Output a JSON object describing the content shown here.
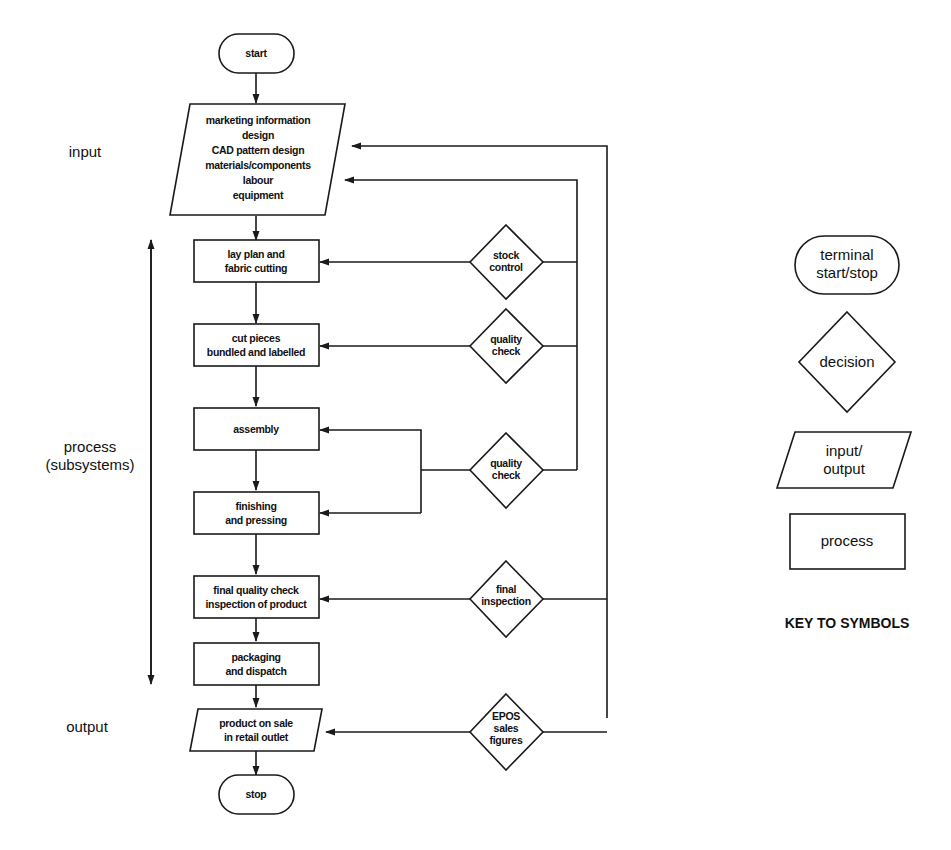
{
  "flowchart": {
    "start": "start",
    "stop": "stop",
    "input_box": [
      "marketing information",
      "design",
      "CAD pattern design",
      "materials/components",
      "labour",
      "equipment"
    ],
    "processes": [
      [
        "lay plan and",
        "fabric cutting"
      ],
      [
        "cut pieces",
        "bundled and labelled"
      ],
      [
        "assembly"
      ],
      [
        "finishing",
        "and pressing"
      ],
      [
        "final quality check",
        "inspection of product"
      ],
      [
        "packaging",
        "and dispatch"
      ]
    ],
    "output_box": [
      "product on sale",
      "in retail outlet"
    ],
    "decisions": [
      [
        "stock",
        "control"
      ],
      [
        "quality",
        "check"
      ],
      [
        "quality",
        "check"
      ],
      [
        "final",
        "inspection"
      ],
      [
        "EPOS",
        "sales",
        "figures"
      ]
    ]
  },
  "side_labels": {
    "input": "input",
    "process": [
      "process",
      "(subsystems)"
    ],
    "output": "output"
  },
  "key": {
    "terminal": [
      "terminal",
      "start/stop"
    ],
    "decision": "decision",
    "input_output": [
      "input/",
      "output"
    ],
    "process": "process",
    "title": "KEY TO SYMBOLS"
  }
}
